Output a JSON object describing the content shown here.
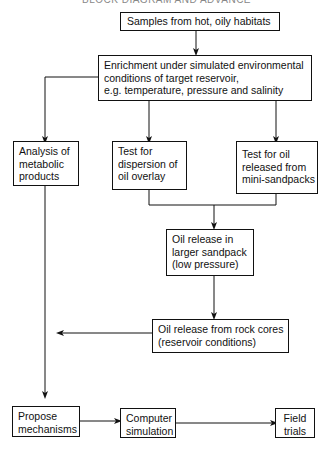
{
  "header": {
    "partial_title": "BLOCK DIAGRAM AND ADVANCE"
  },
  "nodes": {
    "samples": {
      "lines": [
        "Samples from hot, oily habitats"
      ]
    },
    "enrichment": {
      "lines": [
        "Enrichment under simulated environmental",
        "conditions of target reservoir,",
        "e.g. temperature, pressure and salinity"
      ]
    },
    "analysis": {
      "lines": [
        "Analysis of",
        "metabolic",
        "products"
      ]
    },
    "dispersion": {
      "lines": [
        "Test for",
        "dispersion of",
        "oil overlay"
      ]
    },
    "mini_sandpacks": {
      "lines": [
        "Test for oil",
        "released from",
        "mini-sandpacks"
      ]
    },
    "larger_sandpack": {
      "lines": [
        "Oil release in",
        "larger sandpack",
        "(low pressure)"
      ]
    },
    "rock_cores": {
      "lines": [
        "Oil release from rock cores",
        "(reservoir conditions)"
      ]
    },
    "propose": {
      "lines": [
        "Propose",
        "mechanisms"
      ]
    },
    "simulation": {
      "lines": [
        "Computer",
        "simulation"
      ]
    },
    "field": {
      "lines": [
        "Field",
        "trials"
      ]
    }
  },
  "colors": {
    "line": "#111111",
    "background": "#ffffff"
  }
}
